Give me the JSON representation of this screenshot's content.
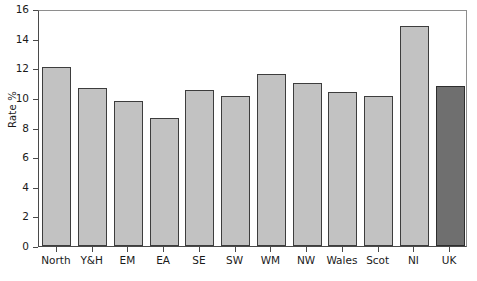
{
  "chart_data": {
    "type": "bar",
    "title": "",
    "xlabel": "",
    "ylabel": "Rate %",
    "ylim": [
      0,
      16
    ],
    "ytick_values": [
      0,
      2,
      4,
      6,
      8,
      10,
      12,
      14,
      16
    ],
    "ytick_labels": [
      "0",
      "2",
      "4",
      "6",
      "8",
      "10",
      "12",
      "14",
      "16"
    ],
    "grid": false,
    "legend": null,
    "categories": [
      "North",
      "Y&H",
      "EM",
      "EA",
      "SE",
      "SW",
      "WM",
      "NW",
      "Wales",
      "Scot",
      "NI",
      "UK"
    ],
    "values": [
      12.1,
      10.65,
      9.8,
      8.65,
      10.55,
      10.1,
      11.6,
      11.0,
      10.4,
      10.1,
      14.85,
      10.8
    ],
    "highlight_index": 11,
    "colors": {
      "bar_fill": "#c2c2c2",
      "bar_edge": "#3d3d3d",
      "highlight_fill": "#6f6f6f",
      "highlight_edge": "#2e2e2e",
      "axis": "#4a4a4a",
      "background": "#ffffff",
      "text": "#1a1a1a"
    }
  }
}
